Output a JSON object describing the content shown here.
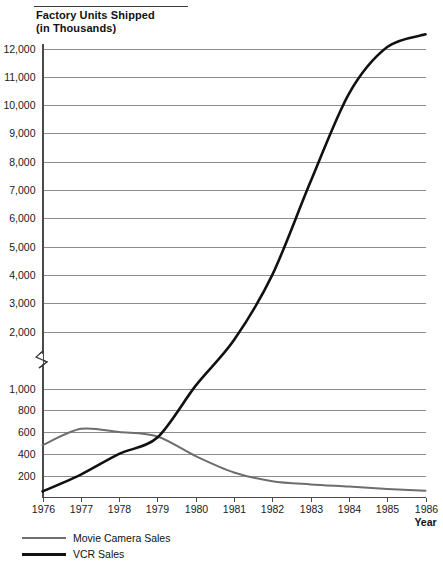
{
  "chart_data": {
    "type": "line",
    "title": "Factory Units Shipped (in Thousands)",
    "title_line1": "Factory Units Shipped",
    "title_line2": "(in Thousands)",
    "xlabel": "Year",
    "ylabel": "",
    "categories": [
      1976,
      1977,
      1978,
      1979,
      1980,
      1981,
      1982,
      1983,
      1984,
      1985,
      1986
    ],
    "x_tick_labels": [
      "1976",
      "1977",
      "1978",
      "1979",
      "1980",
      "1981",
      "1982",
      "1983",
      "1984",
      "1985",
      "1986"
    ],
    "y_tick_labels": [
      "12,000",
      "11,000",
      "10,000",
      "9,000",
      "8,000",
      "7,000",
      "6,000",
      "5,000",
      "4,000",
      "3,000",
      "2,000",
      "1,000",
      "800",
      "600",
      "400",
      "200"
    ],
    "y_tick_values": [
      12000,
      11000,
      10000,
      9000,
      8000,
      7000,
      6000,
      5000,
      4000,
      3000,
      2000,
      1000,
      800,
      600,
      400,
      200
    ],
    "ylim": [
      0,
      12700
    ],
    "axis_break": {
      "from": 1000,
      "to": 2000,
      "style": "zigzag",
      "position": "left-axis"
    },
    "grid": true,
    "legend_position": "bottom-left",
    "series": [
      {
        "name": "Movie Camera Sales",
        "color": "#6e6e6e",
        "width": 2.0,
        "values": [
          480,
          630,
          600,
          560,
          380,
          230,
          150,
          120,
          100,
          78,
          62
        ]
      },
      {
        "name": "VCR Sales",
        "color": "#111111",
        "width": 2.6,
        "values": [
          55,
          210,
          400,
          550,
          1050,
          1850,
          4000,
          7300,
          10400,
          12050,
          12500
        ]
      }
    ]
  },
  "legend": {
    "items": [
      {
        "label": "Movie Camera Sales",
        "color": "#6e6e6e",
        "thickness": "2px"
      },
      {
        "label": "VCR Sales",
        "color": "#111111",
        "thickness": "3px"
      }
    ]
  }
}
